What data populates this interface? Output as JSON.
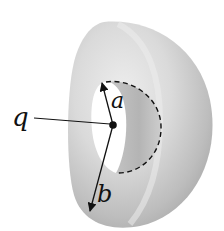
{
  "figure": {
    "labels": {
      "charge": "q",
      "inner_radius": "a",
      "outer_radius": "b"
    },
    "colors": {
      "shell_light": "#e6e6e6",
      "shell_mid": "#cfcfcf",
      "shell_dark": "#a9a9a9",
      "cavity": "#ffffff",
      "ink": "#111111"
    }
  }
}
